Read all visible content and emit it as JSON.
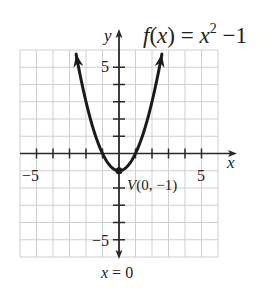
{
  "chart_data": {
    "type": "line",
    "title_parts": {
      "fx": "f",
      "lp": "(",
      "x": "x",
      "rp": ")",
      "eq": " = ",
      "base": "x",
      "exp": "2",
      "rest": " −1"
    },
    "function": "x^2 - 1",
    "xlabel": "x",
    "ylabel": "y",
    "xlim": [
      -6,
      6
    ],
    "ylim": [
      -6,
      6
    ],
    "grid": true,
    "x_ticks": [
      -5,
      -4,
      -3,
      -2,
      -1,
      1,
      2,
      3,
      4,
      5
    ],
    "y_ticks": [
      -5,
      -4,
      -3,
      -2,
      1,
      2,
      3,
      4,
      5
    ],
    "x_tick_labels": {
      "neg": "−5",
      "pos": "5"
    },
    "y_tick_labels": {
      "pos": "5",
      "neg": "−5"
    },
    "x": [
      -2.6,
      -2,
      -1.5,
      -1,
      -0.5,
      0,
      0.5,
      1,
      1.5,
      2,
      2.6
    ],
    "y": [
      5.76,
      3,
      1.25,
      0,
      -0.75,
      -1,
      -0.75,
      0,
      1.25,
      3,
      5.76
    ],
    "annotations": [
      {
        "text": "V(0, −1)",
        "point": [
          0,
          -1
        ],
        "label_v": "V",
        "label_rest": "(0, −1)"
      },
      {
        "text": "x = 0",
        "description": "axis of symmetry"
      }
    ],
    "axis_of_symmetry_label": "x = 0",
    "vertex_label": "V(0, −1)",
    "colors": {
      "curve": "#1a1a1a",
      "axis": "#2a2a2a",
      "grid": "#cfcfcf",
      "text": "#222222"
    }
  }
}
